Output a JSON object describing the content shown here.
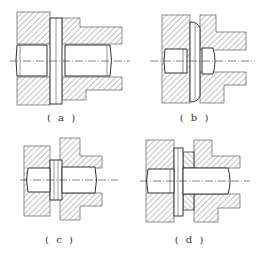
{
  "figure": {
    "panels": [
      {
        "id": "a",
        "label": "( a )"
      },
      {
        "id": "b",
        "label": "( b )"
      },
      {
        "id": "c",
        "label": "( c )"
      },
      {
        "id": "d",
        "label": "( d )"
      }
    ]
  },
  "colors": {
    "line": "#333333",
    "hatch": "#555555",
    "background": "#ffffff"
  }
}
